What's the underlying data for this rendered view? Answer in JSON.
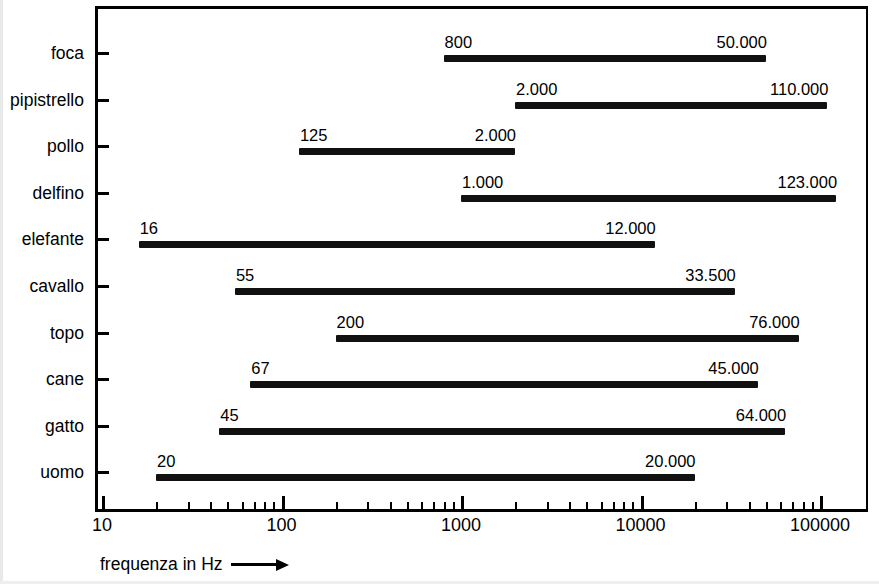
{
  "chart_data": {
    "type": "bar",
    "orientation": "horizontal-range",
    "title": "",
    "xlabel": "frequenza in Hz",
    "ylabel": "",
    "xscale": "log",
    "xlim": [
      10,
      200000
    ],
    "grid": false,
    "legend": null,
    "x_tick_labels": [
      "10",
      "100",
      "1000",
      "10000",
      "100000"
    ],
    "x_tick_values": [
      10,
      100,
      1000,
      10000,
      100000
    ],
    "categories": [
      "foca",
      "pipistrello",
      "pollo",
      "delfino",
      "elefante",
      "cavallo",
      "topo",
      "cane",
      "gatto",
      "uomo"
    ],
    "series": [
      {
        "name": "intervallo di frequenza udibile",
        "ranges": [
          {
            "category": "foca",
            "min": 800,
            "max": 50000,
            "min_label": "800",
            "max_label": "50.000"
          },
          {
            "category": "pipistrello",
            "min": 2000,
            "max": 110000,
            "min_label": "2.000",
            "max_label": "110.000"
          },
          {
            "category": "pollo",
            "min": 125,
            "max": 2000,
            "min_label": "125",
            "max_label": "2.000"
          },
          {
            "category": "delfino",
            "min": 1000,
            "max": 123000,
            "min_label": "1.000",
            "max_label": "123.000"
          },
          {
            "category": "elefante",
            "min": 16,
            "max": 12000,
            "min_label": "16",
            "max_label": "12.000"
          },
          {
            "category": "cavallo",
            "min": 55,
            "max": 33500,
            "min_label": "55",
            "max_label": "33.500"
          },
          {
            "category": "topo",
            "min": 200,
            "max": 76000,
            "min_label": "200",
            "max_label": "76.000"
          },
          {
            "category": "cane",
            "min": 67,
            "max": 45000,
            "min_label": "67",
            "max_label": "45.000"
          },
          {
            "category": "gatto",
            "min": 45,
            "max": 64000,
            "min_label": "45",
            "max_label": "64.000"
          },
          {
            "category": "uomo",
            "min": 20,
            "max": 20000,
            "min_label": "20",
            "max_label": "20.000"
          }
        ]
      }
    ],
    "colors": {
      "bar": "#111111",
      "axis": "#000000",
      "text": "#000000",
      "background": "#ffffff"
    }
  },
  "axis": {
    "x_caption": "frequenza in Hz",
    "x_caption_arrow": "right-arrow"
  }
}
